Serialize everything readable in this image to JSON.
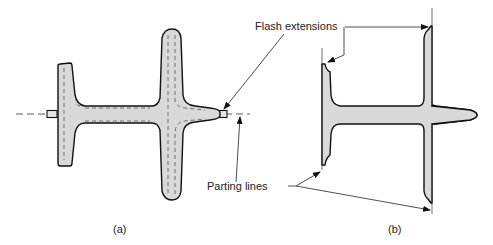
{
  "figure": {
    "labels": {
      "flash_extensions": "Flash extensions",
      "parting_lines": "Parting lines"
    },
    "panels": [
      {
        "id": "a",
        "caption": "(a)"
      },
      {
        "id": "b",
        "caption": "(b)"
      }
    ],
    "colors": {
      "part_fill": "#d9d9d9",
      "outline": "#111111",
      "background": "#ffffff"
    }
  }
}
